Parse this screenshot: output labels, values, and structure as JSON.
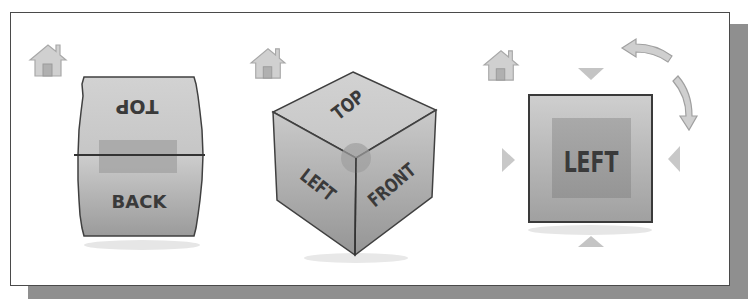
{
  "viewcubes": [
    {
      "name": "viewcube-top-back",
      "home_icon": "home-icon",
      "faces": {
        "top": "TOP",
        "back": "BACK"
      }
    },
    {
      "name": "viewcube-isometric",
      "home_icon": "home-icon",
      "faces": {
        "top": "TOP",
        "left": "LEFT",
        "front": "FRONT"
      }
    },
    {
      "name": "viewcube-left-face",
      "home_icon": "home-icon",
      "faces": {
        "left": "LEFT"
      },
      "controls": [
        "arrow-down-icon",
        "arrow-up-icon",
        "arrow-left-icon",
        "arrow-right-icon",
        "rotate-counterclockwise-icon",
        "rotate-clockwise-icon"
      ]
    }
  ],
  "colors": {
    "face_light": "#d6d6d6",
    "face_dark": "#9a9a9a",
    "highlight": "#a8a8a8",
    "edge": "#404040",
    "arrow": "#c4c4c4",
    "shadow": "#8f8f8f"
  }
}
